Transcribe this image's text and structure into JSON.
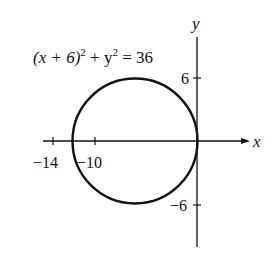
{
  "equation": {
    "base": "(x + 6)",
    "exp1": "2",
    "mid": " + y",
    "exp2": "2",
    "rhs": " = 36"
  },
  "axes": {
    "x_label": "x",
    "y_label": "y",
    "x_ticks": [
      "−14",
      "−10"
    ],
    "y_ticks": [
      "6",
      "−6"
    ]
  },
  "circle": {
    "center": [
      -6,
      0
    ],
    "radius": 6,
    "color": "#111111"
  }
}
